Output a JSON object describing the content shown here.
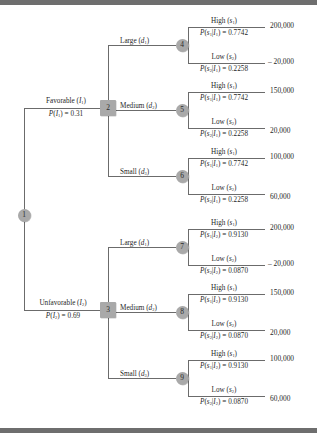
{
  "diagram": {
    "type": "decision-tree",
    "node_fill": "#a9a9a9",
    "line_color": "#6b6b6b"
  },
  "nodes": [
    {
      "id": "1",
      "label": "1",
      "shape": "chance"
    },
    {
      "id": "2",
      "label": "2",
      "shape": "decision"
    },
    {
      "id": "3",
      "label": "3",
      "shape": "decision"
    },
    {
      "id": "4",
      "label": "4",
      "shape": "chance"
    },
    {
      "id": "5",
      "label": "5",
      "shape": "chance"
    },
    {
      "id": "6",
      "label": "6",
      "shape": "chance"
    },
    {
      "id": "7",
      "label": "7",
      "shape": "chance"
    },
    {
      "id": "8",
      "label": "8",
      "shape": "chance"
    },
    {
      "id": "9",
      "label": "9",
      "shape": "chance"
    }
  ],
  "indicator_branches": {
    "favorable": {
      "name": "Favorable (I1)",
      "prob_text": "P(I1) = 0.31",
      "prob_value": 0.31
    },
    "unfavorable": {
      "name": "Unfavorable (I2)",
      "prob_text": "P(I2) = 0.69",
      "prob_value": 0.69
    }
  },
  "decisions": [
    {
      "key": "large",
      "label": "Large (d1)"
    },
    {
      "key": "medium",
      "label": "Medium (d2)"
    },
    {
      "key": "small",
      "label": "Small (d3)"
    }
  ],
  "outcome_labels": {
    "high": "High (s1)",
    "low": "Low (s2)"
  },
  "branches": [
    {
      "node": "4",
      "parent": "2",
      "indicator": "I1",
      "decision": "Large (d1)",
      "high": {
        "label": "High (s1)",
        "prob_text": "P(s1|I1) = 0.7742",
        "prob": 0.7742,
        "payoff": "200,000",
        "payoff_value": 200000
      },
      "low": {
        "label": "Low (s2)",
        "prob_text": "P(s2|I1) = 0.2258",
        "prob": 0.2258,
        "payoff": "– 20,000",
        "payoff_value": -20000
      }
    },
    {
      "node": "5",
      "parent": "2",
      "indicator": "I1",
      "decision": "Medium (d2)",
      "high": {
        "label": "High (s1)",
        "prob_text": "P(s1|I1) = 0.7742",
        "prob": 0.7742,
        "payoff": "150,000",
        "payoff_value": 150000
      },
      "low": {
        "label": "Low (s2)",
        "prob_text": "P(s2|I1) = 0.2258",
        "prob": 0.2258,
        "payoff": "20,000",
        "payoff_value": 20000
      }
    },
    {
      "node": "6",
      "parent": "2",
      "indicator": "I1",
      "decision": "Small (d3)",
      "high": {
        "label": "High (s1)",
        "prob_text": "P(s1|I1) = 0.7742",
        "prob": 0.7742,
        "payoff": "100,000",
        "payoff_value": 100000
      },
      "low": {
        "label": "Low (s2)",
        "prob_text": "P(s2|I1) = 0.2258",
        "prob": 0.2258,
        "payoff": "60,000",
        "payoff_value": 60000
      }
    },
    {
      "node": "7",
      "parent": "3",
      "indicator": "I2",
      "decision": "Large (d1)",
      "high": {
        "label": "High (s1)",
        "prob_text": "P(s1|I2) = 0.9130",
        "prob": 0.913,
        "payoff": "200,000",
        "payoff_value": 200000
      },
      "low": {
        "label": "Low (s2)",
        "prob_text": "P(s2|I2) = 0.0870",
        "prob": 0.087,
        "payoff": "– 20,000",
        "payoff_value": -20000
      }
    },
    {
      "node": "8",
      "parent": "3",
      "indicator": "I2",
      "decision": "Medium (d2)",
      "high": {
        "label": "High (s1)",
        "prob_text": "P(s1|I2) = 0.9130",
        "prob": 0.913,
        "payoff": "150,000",
        "payoff_value": 150000
      },
      "low": {
        "label": "Low (s2)",
        "prob_text": "P(s2|I2) = 0.0870",
        "prob": 0.087,
        "payoff": "20,000",
        "payoff_value": 20000
      }
    },
    {
      "node": "9",
      "parent": "3",
      "indicator": "I2",
      "decision": "Small (d3)",
      "high": {
        "label": "High (s1)",
        "prob_text": "P(s1|I2) = 0.9130",
        "prob": 0.913,
        "payoff": "100,000",
        "payoff_value": 100000
      },
      "low": {
        "label": "Low (s2)",
        "prob_text": "P(s2|I2) = 0.0870",
        "prob": 0.087,
        "payoff": "60,000",
        "payoff_value": 60000
      }
    }
  ]
}
